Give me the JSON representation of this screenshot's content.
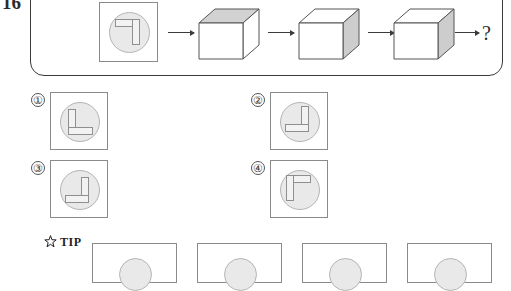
{
  "question": {
    "number": "16",
    "unknown_label": "?"
  },
  "stem": {
    "panel_name": "question-stem-panel",
    "start_tile": {
      "shape_name": "giyeok-top-right",
      "description": "rotated L glyph inside circle"
    },
    "arrows": [
      "arrow-1",
      "arrow-2",
      "arrow-3",
      "arrow-4"
    ],
    "cubes": [
      {
        "name": "cube-1",
        "shaded_face": "top"
      },
      {
        "name": "cube-2",
        "shaded_face": "right"
      },
      {
        "name": "cube-3",
        "shaded_face": "right"
      }
    ]
  },
  "options": [
    {
      "label": "①",
      "number": "1",
      "shape_name": "L-shape-bottom-left"
    },
    {
      "label": "②",
      "number": "2",
      "shape_name": "mirrored-L-bottom-right"
    },
    {
      "label": "③",
      "number": "3",
      "shape_name": "mirrored-L-lowered"
    },
    {
      "label": "④",
      "number": "4",
      "shape_name": "gamma-shape-top-left"
    }
  ],
  "tip": {
    "label": "TIP",
    "icon": "star-icon"
  },
  "tip_tiles": [
    {
      "name": "tip-tile-1"
    },
    {
      "name": "tip-tile-2"
    },
    {
      "name": "tip-tile-3"
    },
    {
      "name": "tip-tile-4"
    }
  ],
  "colors": {
    "ink": "#2b2b2b",
    "frame": "#8a8a8a",
    "disc_fill": "#e9e9e9",
    "glyph_fill": "#f2f2f2",
    "cube_top": "#d3d3d3",
    "cube_side": "#cfcfcf",
    "cube_front": "#ffffff"
  }
}
